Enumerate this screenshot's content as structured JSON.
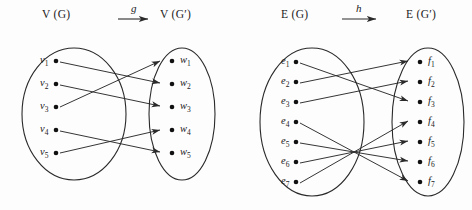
{
  "figure": {
    "background": "#fdfdfd",
    "ink": "#2a2a2a"
  },
  "panels": [
    {
      "id": "vertex-map",
      "left_set_label": "V (G)",
      "right_set_label": "V (G′)",
      "map_name": "g",
      "arrow_glyph": "→",
      "domain_nodes": [
        "v1",
        "v2",
        "v3",
        "v4",
        "v5"
      ],
      "codomain_nodes": [
        "w1",
        "w2",
        "w3",
        "w4",
        "w5"
      ],
      "domain_labels": [
        {
          "base": "v",
          "sub": "1"
        },
        {
          "base": "v",
          "sub": "2"
        },
        {
          "base": "v",
          "sub": "3"
        },
        {
          "base": "v",
          "sub": "4"
        },
        {
          "base": "v",
          "sub": "5"
        }
      ],
      "codomain_labels": [
        {
          "base": "w",
          "sub": "1"
        },
        {
          "base": "w",
          "sub": "2"
        },
        {
          "base": "w",
          "sub": "3"
        },
        {
          "base": "w",
          "sub": "4"
        },
        {
          "base": "w",
          "sub": "5"
        }
      ],
      "mapping": [
        {
          "from": "v1",
          "to": "w2"
        },
        {
          "from": "v2",
          "to": "w3"
        },
        {
          "from": "v3",
          "to": "w1"
        },
        {
          "from": "v4",
          "to": "w5"
        },
        {
          "from": "v5",
          "to": "w4"
        }
      ]
    },
    {
      "id": "edge-map",
      "left_set_label": "E (G)",
      "right_set_label": "E (G′)",
      "map_name": "h",
      "arrow_glyph": "→",
      "domain_nodes": [
        "e1",
        "e2",
        "e3",
        "e4",
        "e5",
        "e6",
        "e7"
      ],
      "codomain_nodes": [
        "f1",
        "f2",
        "f3",
        "f4",
        "f5",
        "f6",
        "f7"
      ],
      "domain_labels": [
        {
          "base": "e",
          "sub": "1"
        },
        {
          "base": "e",
          "sub": "2"
        },
        {
          "base": "e",
          "sub": "3"
        },
        {
          "base": "e",
          "sub": "4"
        },
        {
          "base": "e",
          "sub": "5"
        },
        {
          "base": "e",
          "sub": "6"
        },
        {
          "base": "e",
          "sub": "7"
        }
      ],
      "codomain_labels": [
        {
          "base": "f",
          "sub": "1"
        },
        {
          "base": "f",
          "sub": "2"
        },
        {
          "base": "f",
          "sub": "3"
        },
        {
          "base": "f",
          "sub": "4"
        },
        {
          "base": "f",
          "sub": "5"
        },
        {
          "base": "f",
          "sub": "6"
        },
        {
          "base": "f",
          "sub": "7"
        }
      ],
      "mapping": [
        {
          "from": "e1",
          "to": "f3"
        },
        {
          "from": "e2",
          "to": "f1"
        },
        {
          "from": "e3",
          "to": "f2"
        },
        {
          "from": "e4",
          "to": "f7"
        },
        {
          "from": "e5",
          "to": "f6"
        },
        {
          "from": "e6",
          "to": "f5"
        },
        {
          "from": "e7",
          "to": "f4"
        }
      ]
    }
  ]
}
